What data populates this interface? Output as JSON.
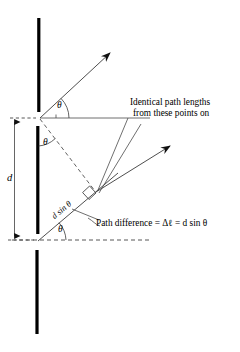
{
  "figure": {
    "title_alt": "Double-slit path difference diagram",
    "colors": {
      "ink": "#000000",
      "barrier": "#000000",
      "background": "#ffffff"
    },
    "barrier": {
      "name": "opaque-screen-with-two-slits",
      "segments": [
        {
          "label_alt": "upper barrier segment"
        },
        {
          "label_alt": "middle barrier segment"
        },
        {
          "label_alt": "lower barrier segment"
        }
      ]
    },
    "labels": {
      "slit_separation": "d",
      "angle_upper": "θ",
      "angle_middle": "θ",
      "angle_lower": "θ",
      "path_segment": "d sin θ",
      "identical_paths_line1": "Identical path lengths",
      "identical_paths_line2": "from these points on",
      "path_difference": "Path difference = Δℓ = d sin θ"
    },
    "geometry": {
      "upper_slit": {
        "x": 40,
        "y": 118
      },
      "lower_slit": {
        "x": 38,
        "y": 240
      },
      "ray_upper_tip": {
        "x": 112,
        "y": 51
      },
      "ray_lower_tip": {
        "x": 172,
        "y": 144
      },
      "right_angle_marker": {
        "x": 89,
        "y": 196
      },
      "angle_value_alt": "θ",
      "dashed_axis_y": 240,
      "horizontal_ray_y": 118
    }
  }
}
